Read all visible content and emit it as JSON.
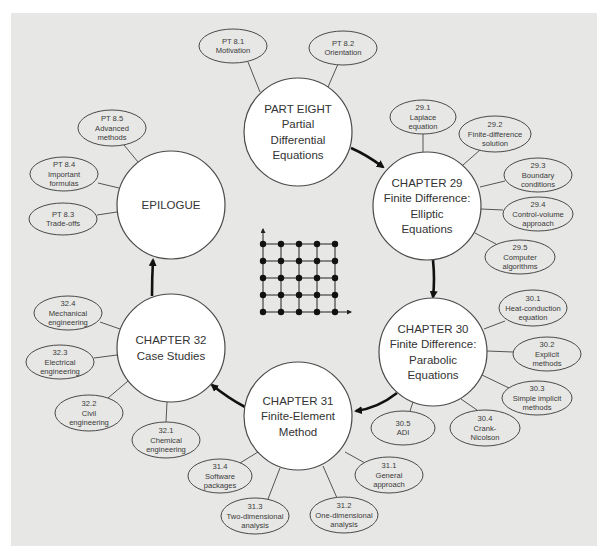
{
  "diagram": {
    "colors": {
      "panel": "#e7e7e5",
      "circle_fill": "#ffffff",
      "stroke": "#4a4a4a",
      "arrow": "#111111",
      "text": "#333333"
    },
    "nodes": [
      {
        "id": "part-eight",
        "lines": [
          "PART EIGHT",
          "Partial",
          "Differential",
          "Equations"
        ],
        "cx": 298,
        "cy": 132,
        "r": 54,
        "subtopics": [
          {
            "num": "PT 8.1",
            "lines": [
              "Motivation"
            ],
            "cx": 233,
            "cy": 46,
            "rx": 34,
            "ry": 17,
            "lx1": 248,
            "ly1": 62,
            "lx2": 260,
            "ly2": 92
          },
          {
            "num": "PT 8.2",
            "lines": [
              "Orientation"
            ],
            "cx": 343,
            "cy": 48,
            "rx": 34,
            "ry": 17,
            "lx1": 338,
            "ly1": 64,
            "lx2": 328,
            "ly2": 87
          }
        ]
      },
      {
        "id": "chapter-29",
        "lines": [
          "CHAPTER 29",
          "Finite Difference:",
          "Elliptic",
          "Equations"
        ],
        "cx": 427,
        "cy": 206,
        "r": 54,
        "subtopics": [
          {
            "num": "29.1",
            "lines": [
              "Laplace",
              "equation"
            ],
            "cx": 423,
            "cy": 117,
            "rx": 33,
            "ry": 17,
            "lx1": 423,
            "ly1": 134,
            "lx2": 423,
            "ly2": 152
          },
          {
            "num": "29.2",
            "lines": [
              "Finite-difference",
              "solution"
            ],
            "cx": 495,
            "cy": 134,
            "rx": 36,
            "ry": 18,
            "lx1": 480,
            "ly1": 150,
            "lx2": 463,
            "ly2": 165
          },
          {
            "num": "29.3",
            "lines": [
              "Boundary",
              "conditions"
            ],
            "cx": 538,
            "cy": 175,
            "rx": 34,
            "ry": 17,
            "lx1": 505,
            "ly1": 181,
            "lx2": 480,
            "ly2": 187
          },
          {
            "num": "29.4",
            "lines": [
              "Control-volume",
              "approach"
            ],
            "cx": 538,
            "cy": 214,
            "rx": 35,
            "ry": 17,
            "lx1": 503,
            "ly1": 210,
            "lx2": 481,
            "ly2": 209
          },
          {
            "num": "29.5",
            "lines": [
              "Computer",
              "algorithms"
            ],
            "cx": 520,
            "cy": 257,
            "rx": 35,
            "ry": 17,
            "lx1": 496,
            "ly1": 244,
            "lx2": 475,
            "ly2": 233
          }
        ]
      },
      {
        "id": "chapter-30",
        "lines": [
          "CHAPTER 30",
          "Finite Difference:",
          "Parabolic",
          "Equations"
        ],
        "cx": 433,
        "cy": 352,
        "r": 54,
        "subtopics": [
          {
            "num": "30.1",
            "lines": [
              "Heat-conduction",
              "equation"
            ],
            "cx": 533,
            "cy": 308,
            "rx": 34,
            "ry": 18,
            "lx1": 505,
            "ly1": 321,
            "lx2": 484,
            "ly2": 329
          },
          {
            "num": "30.2",
            "lines": [
              "Explicit",
              "methods"
            ],
            "cx": 547,
            "cy": 354,
            "rx": 34,
            "ry": 17,
            "lx1": 513,
            "ly1": 352,
            "lx2": 487,
            "ly2": 351
          },
          {
            "num": "30.3",
            "lines": [
              "Simple implicit",
              "methods"
            ],
            "cx": 537,
            "cy": 398,
            "rx": 35,
            "ry": 17,
            "lx1": 509,
            "ly1": 388,
            "lx2": 482,
            "ly2": 375
          },
          {
            "num": "30.4",
            "lines": [
              "Crank-",
              "Nicolson"
            ],
            "cx": 485,
            "cy": 428,
            "rx": 35,
            "ry": 18,
            "lx1": 477,
            "ly1": 410,
            "lx2": 461,
            "ly2": 399
          },
          {
            "num": "30.5",
            "lines": [
              "ADI"
            ],
            "cx": 403,
            "cy": 428,
            "rx": 32,
            "ry": 17,
            "lx1": 410,
            "ly1": 411,
            "lx2": 413,
            "ly2": 402
          }
        ]
      },
      {
        "id": "chapter-31",
        "lines": [
          "CHAPTER 31",
          "Finite-Element",
          "Method"
        ],
        "cx": 298,
        "cy": 416,
        "r": 54,
        "subtopics": [
          {
            "num": "31.1",
            "lines": [
              "General",
              "approach"
            ],
            "cx": 389,
            "cy": 475,
            "rx": 34,
            "ry": 18,
            "lx1": 365,
            "ly1": 463,
            "lx2": 345,
            "ly2": 452
          },
          {
            "num": "31.2",
            "lines": [
              "One-dimensional",
              "analysis"
            ],
            "cx": 344,
            "cy": 515,
            "rx": 34,
            "ry": 18,
            "lx1": 337,
            "ly1": 498,
            "lx2": 323,
            "ly2": 466
          },
          {
            "num": "31.3",
            "lines": [
              "Two-dimensional",
              "analysis"
            ],
            "cx": 255,
            "cy": 516,
            "rx": 34,
            "ry": 18,
            "lx1": 268,
            "ly1": 499,
            "lx2": 280,
            "ly2": 468
          },
          {
            "num": "31.4",
            "lines": [
              "Software",
              "packages"
            ],
            "cx": 220,
            "cy": 476,
            "rx": 32,
            "ry": 17,
            "lx1": 240,
            "ly1": 463,
            "lx2": 258,
            "ly2": 452
          }
        ]
      },
      {
        "id": "chapter-32",
        "lines": [
          "CHAPTER 32",
          "Case Studies"
        ],
        "cx": 171,
        "cy": 348,
        "r": 54,
        "subtopics": [
          {
            "num": "32.1",
            "lines": [
              "Chemical",
              "engineering"
            ],
            "cx": 166,
            "cy": 440,
            "rx": 34,
            "ry": 18,
            "lx1": 166,
            "ly1": 422,
            "lx2": 167,
            "ly2": 402
          },
          {
            "num": "32.2",
            "lines": [
              "Civil",
              "engineering"
            ],
            "cx": 89,
            "cy": 413,
            "rx": 34,
            "ry": 18,
            "lx1": 108,
            "ly1": 398,
            "lx2": 128,
            "ly2": 381
          },
          {
            "num": "32.3",
            "lines": [
              "Electrical",
              "engineering"
            ],
            "cx": 60,
            "cy": 362,
            "rx": 34,
            "ry": 17,
            "lx1": 94,
            "ly1": 358,
            "lx2": 117,
            "ly2": 355
          },
          {
            "num": "32.4",
            "lines": [
              "Mechanical",
              "engineering"
            ],
            "cx": 68,
            "cy": 313,
            "rx": 34,
            "ry": 17,
            "lx1": 100,
            "ly1": 322,
            "lx2": 120,
            "ly2": 329
          }
        ]
      },
      {
        "id": "epilogue",
        "lines": [
          "EPILOGUE"
        ],
        "cx": 171,
        "cy": 205,
        "r": 54,
        "subtopics": [
          {
            "num": "PT 8.3",
            "lines": [
              "Trade-offs"
            ],
            "cx": 63,
            "cy": 219,
            "rx": 34,
            "ry": 16,
            "lx1": 97,
            "ly1": 215,
            "lx2": 117,
            "ly2": 212
          },
          {
            "num": "PT 8.4",
            "lines": [
              "Important",
              "formulas"
            ],
            "cx": 64,
            "cy": 174,
            "rx": 34,
            "ry": 17,
            "lx1": 98,
            "ly1": 183,
            "lx2": 119,
            "ly2": 188
          },
          {
            "num": "PT 8.5",
            "lines": [
              "Advanced",
              "methods"
            ],
            "cx": 112,
            "cy": 128,
            "rx": 34,
            "ry": 18,
            "lx1": 124,
            "ly1": 145,
            "lx2": 138,
            "ly2": 162
          }
        ]
      }
    ],
    "flow_arrows": [
      {
        "from": "part-eight",
        "to": "chapter-29",
        "path": "M 351 148 Q 367 155 383 167"
      },
      {
        "from": "chapter-29",
        "to": "chapter-30",
        "path": "M 433 260 Q 435 280 433 297"
      },
      {
        "from": "chapter-30",
        "to": "chapter-31",
        "path": "M 397 393 Q 378 408 356 411"
      },
      {
        "from": "chapter-31",
        "to": "chapter-32",
        "path": "M 245 407 Q 228 398 212 385"
      },
      {
        "from": "chapter-32",
        "to": "epilogue",
        "path": "M 152 296 Q 152 278 153 260"
      }
    ],
    "grid_figure": {
      "xs": [
        263,
        281,
        299,
        317,
        335
      ],
      "ys": [
        244,
        261,
        278,
        295,
        312
      ],
      "y_axis_top": 229,
      "x_axis_right": 351
    }
  }
}
